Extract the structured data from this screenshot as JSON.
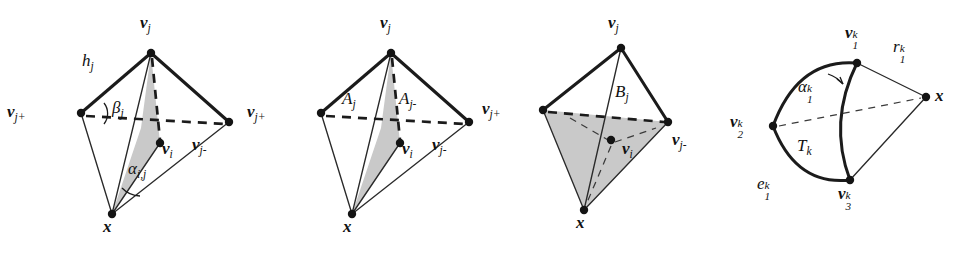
{
  "figure": {
    "caption": "",
    "background_color": "#ffffff",
    "ink_color": "#1b1b1b",
    "shade_color": "#c9c9c9",
    "panel_count": 4
  },
  "panels": [
    {
      "id": "panel-1",
      "name": "tetrahedron-angles",
      "labels": {
        "apex": "v_j",
        "left": "v_{j+}",
        "right": "v_{j-}",
        "interior": "v_i",
        "bottom": "x",
        "height": "h_j",
        "angle_beta": "β_j",
        "angle_alpha": "α_{i,j}"
      },
      "apex_base": "v",
      "apex_sub": "j",
      "left_base": "v",
      "left_sub": "j+",
      "right_base": "v",
      "right_sub": "j-",
      "interior_base": "v",
      "interior_sub": "i",
      "bottom_base": "x",
      "height_base": "h",
      "height_sub": "j",
      "beta_base": "β",
      "beta_sub": "j",
      "alpha_base": "α",
      "alpha_sub": "i,j"
    },
    {
      "id": "panel-2",
      "name": "tetrahedron-areas",
      "labels": {
        "apex": "v_j",
        "left": "v_{j+}",
        "right": "v_{j-}",
        "interior": "v_i",
        "bottom": "x",
        "area_left": "A_j",
        "area_right": "A_{j-}"
      },
      "apex_base": "v",
      "apex_sub": "j",
      "left_base": "v",
      "left_sub": "j+",
      "right_base": "v",
      "right_sub": "j-",
      "interior_base": "v",
      "interior_sub": "i",
      "bottom_base": "x",
      "area_left_base": "A",
      "area_left_sub": "j",
      "area_right_base": "A",
      "area_right_sub": "j-"
    },
    {
      "id": "panel-3",
      "name": "tetrahedron-base-area",
      "labels": {
        "apex": "v_j",
        "left": "v_{j+}",
        "right": "v_{j-}",
        "interior": "v_i",
        "bottom": "x",
        "area_face": "B_j"
      },
      "apex_base": "v",
      "apex_sub": "j",
      "left_base": "v",
      "left_sub": "j+",
      "right_base": "v",
      "right_sub": "j-",
      "interior_base": "v",
      "interior_sub": "i",
      "bottom_base": "x",
      "face_base": "B",
      "face_sub": "j"
    },
    {
      "id": "panel-4",
      "name": "spherical-triangle",
      "labels": {
        "v1": "v_1^k",
        "v2": "v_2^k",
        "v3": "v_3^k",
        "apex_x": "x",
        "radius": "r_1^k",
        "angle": "α_1^k",
        "triangle": "T_k",
        "edge": "e_1^k"
      },
      "v1_base": "v",
      "v1_sub": "1",
      "v1_sup": "k",
      "v2_base": "v",
      "v2_sub": "2",
      "v2_sup": "k",
      "v3_base": "v",
      "v3_sub": "3",
      "v3_sup": "k",
      "x_base": "x",
      "r_base": "r",
      "r_sub": "1",
      "r_sup": "k",
      "alpha_base": "α",
      "alpha_sub": "1",
      "alpha_sup": "k",
      "t_base": "T",
      "t_sub": "k",
      "e_base": "e",
      "e_sub": "1",
      "e_sup": "k"
    }
  ]
}
